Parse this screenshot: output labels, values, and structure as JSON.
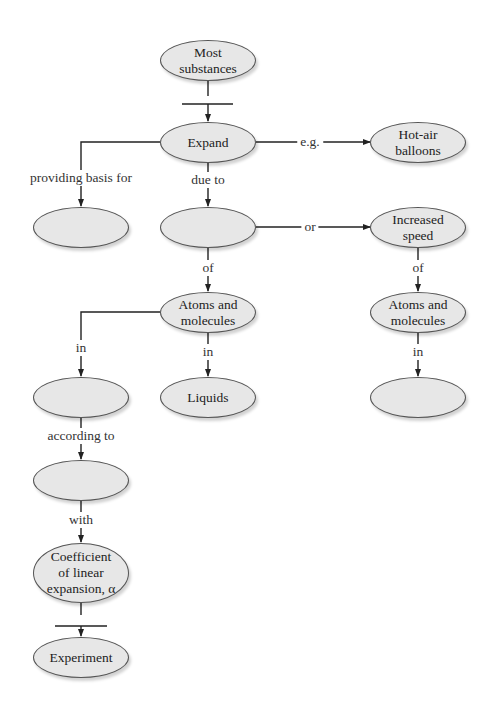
{
  "nodes": {
    "most_substances": "Most\nsubstances",
    "expand": "Expand",
    "hot_air_balloons": "Hot-air\nballoons",
    "blank_left_1": "",
    "blank_center_1": "",
    "increased_speed": "Increased\nspeed",
    "atoms_molecules_center": "Atoms and\nmolecules",
    "atoms_molecules_right": "Atoms and\nmolecules",
    "blank_left_2": "",
    "liquids": "Liquids",
    "blank_right": "",
    "blank_left_3": "",
    "coefficient": "Coefficient\nof linear\nexpansion, α",
    "experiment": "Experiment"
  },
  "links": {
    "eg": "e.g.",
    "providing_basis_for": "providing basis for",
    "due_to": "due to",
    "or": "or",
    "of_center": "of",
    "of_right": "of",
    "in_left": "in",
    "in_center": "in",
    "in_right": "in",
    "according_to": "according to",
    "with": "with"
  },
  "colors": {
    "node_fill": "#e7e7e7",
    "node_border": "#555555",
    "line": "#222222"
  }
}
